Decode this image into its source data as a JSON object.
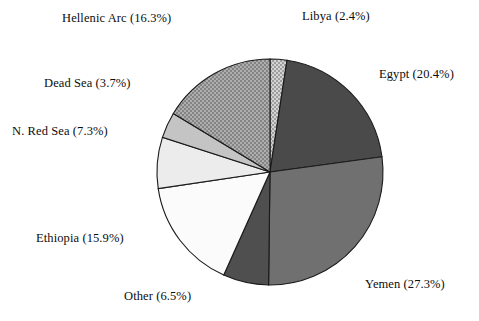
{
  "chart_data": {
    "type": "pie",
    "title": "",
    "subtitle": "",
    "xlabel": "",
    "ylabel": "",
    "legend_position": "none",
    "grid": false,
    "label_format": "name (value%)",
    "start_angle_deg": 0,
    "direction": "clockwise",
    "categories": [
      "Libya",
      "Egypt",
      "Yemen",
      "Other",
      "Ethiopia",
      "N. Red Sea",
      "Dead Sea",
      "Hellenic Arc"
    ],
    "values": [
      2.4,
      20.4,
      27.3,
      6.5,
      15.9,
      7.3,
      3.7,
      16.3
    ],
    "units": "%",
    "slices": [
      {
        "name": "Libya",
        "value": 2.4,
        "label": "Libya (2.4%)",
        "fill": "#b5b5b5",
        "pattern": "checker"
      },
      {
        "name": "Egypt",
        "value": 20.4,
        "label": "Egypt (20.4%)",
        "fill": "#4a4a4a",
        "pattern": "solid"
      },
      {
        "name": "Yemen",
        "value": 27.3,
        "label": "Yemen (27.3%)",
        "fill": "#707070",
        "pattern": "solid"
      },
      {
        "name": "Other",
        "value": 6.5,
        "label": "Other (6.5%)",
        "fill": "#4f4f4f",
        "pattern": "solid"
      },
      {
        "name": "Ethiopia",
        "value": 15.9,
        "label": "Ethiopia (15.9%)",
        "fill": "#fbfbfb",
        "pattern": "solid"
      },
      {
        "name": "N. Red Sea",
        "value": 7.3,
        "label": "N. Red Sea (7.3%)",
        "fill": "#ececec",
        "pattern": "solid"
      },
      {
        "name": "Dead Sea",
        "value": 3.7,
        "label": "Dead Sea (3.7%)",
        "fill": "#c4c4c4",
        "pattern": "solid"
      },
      {
        "name": "Hellenic Arc",
        "value": 16.3,
        "label": "Hellenic Arc (16.3%)",
        "fill": "#9a9a9a",
        "pattern": "checker"
      }
    ],
    "geometry": {
      "center_x": 270,
      "center_y": 172,
      "radius": 113
    },
    "colors": {
      "outline": "#1a1a1a",
      "background": "#ffffff",
      "text": "#0d0d0d"
    }
  }
}
